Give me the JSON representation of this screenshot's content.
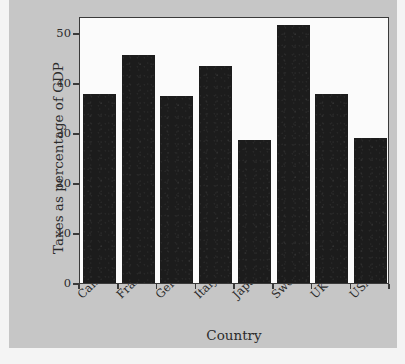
{
  "chart_data": {
    "type": "bar",
    "title": "",
    "subtitle": "",
    "xlabel": "Country",
    "ylabel": "Taxes as percentage of GDP",
    "categories": [
      "Canada",
      "France",
      "Germany",
      "Italy",
      "Japan",
      "Sweden",
      "UK",
      "USA"
    ],
    "values": [
      37.8,
      45.6,
      37.4,
      43.4,
      28.6,
      51.6,
      37.8,
      29.0
    ],
    "series": [
      {
        "name": "Taxes as percentage of GDP",
        "values": [
          37.8,
          45.6,
          37.4,
          43.4,
          28.6,
          51.6,
          37.8,
          29.0
        ]
      }
    ],
    "ylim": [
      0,
      53.4
    ],
    "xlim": [
      0,
      8
    ],
    "yticks": [
      0,
      10,
      20,
      30,
      40,
      50
    ],
    "ytick_labels": [
      "0",
      "10",
      "20",
      "30",
      "40",
      "50"
    ],
    "xtick_labels": [
      "Canada",
      "France",
      "Germany",
      "Italy",
      "Japan",
      "Sweden",
      "UK",
      "USA"
    ],
    "xtick_label_rotation": -45,
    "grid": false,
    "legend": false,
    "legend_position": "none",
    "bar_color": "#1c1c1c",
    "plot_background": "#fbfbfb",
    "figure_background": "#c6c6c6",
    "axis_color": "#3a3a3a",
    "annotations": []
  }
}
